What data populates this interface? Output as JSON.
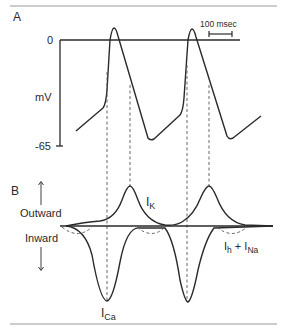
{
  "panel_a": {
    "label": "A",
    "y_axis_label": "mV",
    "y_tick_top": "0",
    "y_tick_bottom": "-65",
    "scale_bar_label": "100 msec"
  },
  "panel_b": {
    "label": "B",
    "outward_label": "Outward",
    "inward_label": "Inward",
    "ik_label_main": "I",
    "ik_label_sub": "K",
    "ica_label_main": "I",
    "ica_label_sub": "Ca",
    "ihna_label_main1": "I",
    "ihna_label_sub1": "h",
    "ihna_plus": " + I",
    "ihna_label_sub2": "Na"
  },
  "colors": {
    "line": "#2a2a2a",
    "dashed": "#555555",
    "rule": "#999999"
  }
}
